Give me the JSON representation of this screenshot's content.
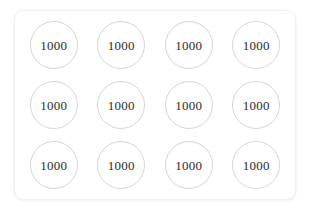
{
  "card": {
    "background_color": "#ffffff",
    "border_color": "#f0f0f0",
    "corner_radius_px": 9
  },
  "grid": {
    "columns": 4,
    "rows": 3,
    "circle_border_color": "#d6d6d6",
    "label_color": "#2b2b2b",
    "cells": [
      {
        "label": "1000",
        "row": 1,
        "col": 1
      },
      {
        "label": "1000",
        "row": 1,
        "col": 2
      },
      {
        "label": "1000",
        "row": 1,
        "col": 3
      },
      {
        "label": "1000",
        "row": 1,
        "col": 4
      },
      {
        "label": "1000",
        "row": 2,
        "col": 1
      },
      {
        "label": "1000",
        "row": 2,
        "col": 2
      },
      {
        "label": "1000",
        "row": 2,
        "col": 3
      },
      {
        "label": "1000",
        "row": 2,
        "col": 4
      },
      {
        "label": "1000",
        "row": 3,
        "col": 1
      },
      {
        "label": "1000",
        "row": 3,
        "col": 2
      },
      {
        "label": "1000",
        "row": 3,
        "col": 3
      },
      {
        "label": "1000",
        "row": 3,
        "col": 4
      }
    ]
  }
}
